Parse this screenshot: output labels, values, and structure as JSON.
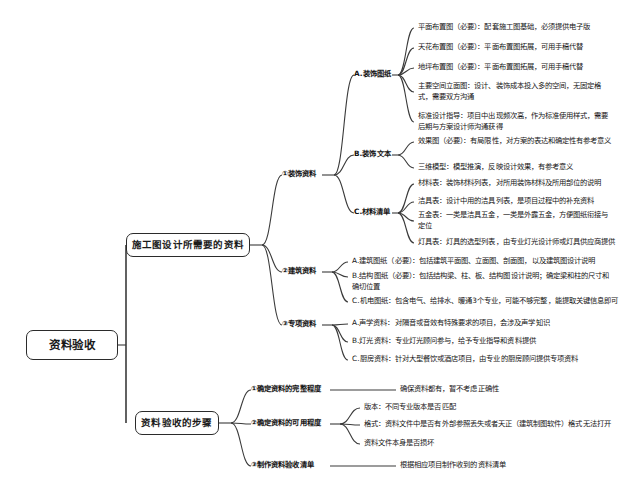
{
  "diagram": {
    "type": "mindmap",
    "title": "资料验收",
    "orientation": "left-to-right",
    "colors": {
      "line": "#3a3a3a",
      "box_border": "#2b2b2b",
      "text": "#141414",
      "background": "#ffffff"
    }
  },
  "root": {
    "label": "资料验收"
  },
  "branches": [
    {
      "label": "施工图设计所需要的资料",
      "children": [
        {
          "label": "①装饰资料",
          "children": [
            {
              "label": "A.装饰图纸",
              "children": [
                {
                  "label": "平面布置图（必要）：配套施工图基础，必须提供电子版"
                },
                {
                  "label": "天花布置图（必要）：平面布置图拓展，可用手稿代替"
                },
                {
                  "label": "地坪布置图（必要）：平面布置图拓展，可用手稿代替"
                },
                {
                  "label": "主要空间立面图：设计、装饰成本投入多的空间，无固定格式，需要双方沟通"
                },
                {
                  "label": "标准设计指导：项目中出现频次高，作为标准使用样式，需要后期与方案设计师沟通获得"
                }
              ]
            },
            {
              "label": "B.装饰文本",
              "children": [
                {
                  "label": "效果图（必要）：有局限性，对方案的表达和确定性有参考意义"
                },
                {
                  "label": "三维模型：模型推演，反映设计效果，有参考意义"
                }
              ]
            },
            {
              "label": "C.材料清单",
              "children": [
                {
                  "label": "材料表：装饰材料列表，对所用装饰材料及所用部位的说明"
                },
                {
                  "label": "洁具表：设计中用的洁具列表，是项目过程中的补充资料"
                },
                {
                  "label": "五金表：一类是洁具五金，一类是外露五金，方便图纸衔接与定位"
                },
                {
                  "label": "灯具表：灯具的选型列表，由专业灯光设计师或灯具供应商提供"
                }
              ]
            }
          ]
        },
        {
          "label": "②建筑资料",
          "children": [
            {
              "label": "A.建筑图纸（必要）：包括建筑平面图、立面图、剖面图，以及建筑图设计说明"
            },
            {
              "label": "B.结构图纸（必要）：包括结构梁、柱、板、结构图设计说明；确定梁和柱的尺寸和确切位置"
            },
            {
              "label": "C.机电图纸：包含电气、给排水、暖通3个专业，可能不够完整，能提取关键信息即可"
            }
          ]
        },
        {
          "label": "③专项资料",
          "children": [
            {
              "label": "A.声学资料：对隔音或音效有特殊要求的项目，会涉及声学知识"
            },
            {
              "label": "B.灯光资料：专业灯光顾问参与，给予专业指导和资料提供"
            },
            {
              "label": "C.厨房资料：针对大型餐饮或酒店项目，由专业的厨房顾问提供专项资料"
            }
          ]
        }
      ]
    },
    {
      "label": "资料验收的步骤",
      "children": [
        {
          "label": "①确定资料的完整程度",
          "children": [
            {
              "label": "确保资料都有，暂不考虑正确性"
            }
          ]
        },
        {
          "label": "②确定资料的可用程度",
          "children": [
            {
              "label": "版本：不同专业版本是否匹配"
            },
            {
              "label": "格式：资料文件中是否有外部参照丢失或者天正（建筑制图软件）格式无法打开"
            },
            {
              "label": "资料文件本身是否损坏"
            }
          ]
        },
        {
          "label": "③制作资料验收清单",
          "children": [
            {
              "label": "根据相应项目制作收到的资料清单"
            }
          ]
        }
      ]
    }
  ]
}
